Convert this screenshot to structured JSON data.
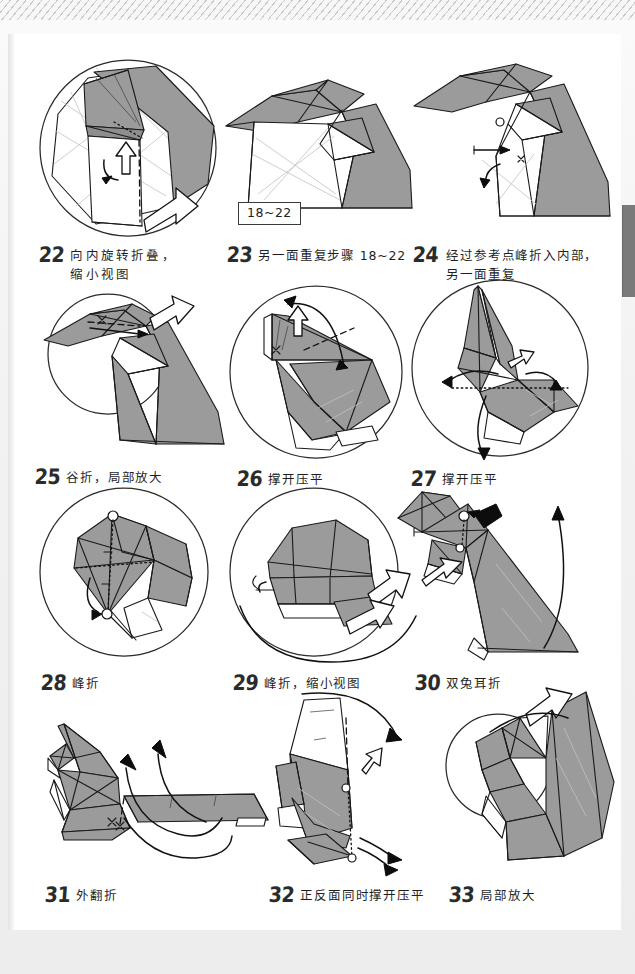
{
  "page": {
    "language": "zh-CN",
    "range_label": "18~22",
    "colors": {
      "paper_white": "#ffffff",
      "paper_gray": "#9b9b9b",
      "ink": "#1a1a1a",
      "background": "#efefef",
      "side_tab": "#7a7a7a"
    }
  },
  "steps": [
    {
      "num": "22",
      "text": "向内旋转折叠，\n缩小视图"
    },
    {
      "num": "23",
      "text": "另一面重复步骤 18~22"
    },
    {
      "num": "24",
      "text": "经过参考点峰折入内部，\n另一面重复"
    },
    {
      "num": "25",
      "text": "谷折，局部放大"
    },
    {
      "num": "26",
      "text": "撑开压平"
    },
    {
      "num": "27",
      "text": "撑开压平"
    },
    {
      "num": "28",
      "text": "峰折"
    },
    {
      "num": "29",
      "text": "峰折，缩小视图"
    },
    {
      "num": "30",
      "text": "双兔耳折"
    },
    {
      "num": "31",
      "text": "外翻折"
    },
    {
      "num": "32",
      "text": "正反面同时撑开压平"
    },
    {
      "num": "33",
      "text": "局部放大"
    }
  ]
}
